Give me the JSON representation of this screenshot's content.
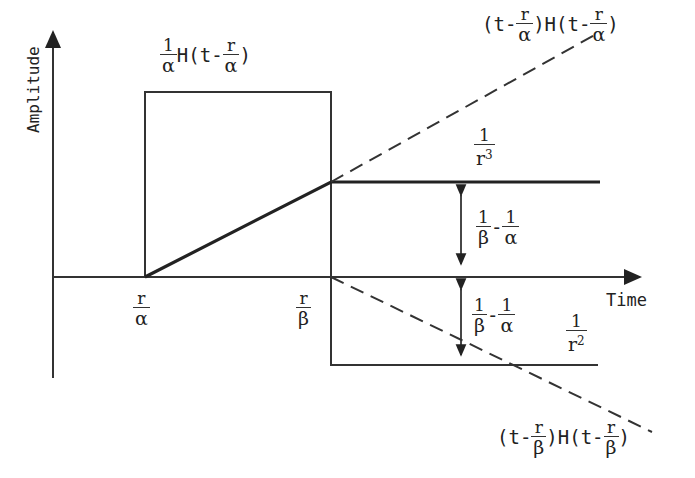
{
  "diagram": {
    "axes": {
      "y_label": "Amplitude",
      "x_label": "Time"
    },
    "x_ticks": [
      {
        "num": "r",
        "den": "α"
      },
      {
        "num": "r",
        "den": "β"
      }
    ],
    "labels": {
      "box": {
        "coef_num": "1",
        "coef_den": "α",
        "func": "H(t-",
        "arg_num": "r",
        "arg_den": "α",
        "close": ")"
      },
      "ramp_alpha": {
        "open": "(t-",
        "n1": "r",
        "d1": "α",
        "mid": ")H(t-",
        "n2": "r",
        "d2": "α",
        "close": ")"
      },
      "ramp_beta": {
        "open": "(t-",
        "n1": "r",
        "d1": "β",
        "mid": ")H(t-",
        "n2": "r",
        "d2": "β",
        "close": ")"
      },
      "r3": {
        "num": "1",
        "den": "r",
        "exp": "3"
      },
      "r2": {
        "num": "1",
        "den": "r",
        "exp": "2"
      },
      "diff_upper": {
        "n1": "1",
        "d1": "β",
        "sep": "-",
        "n2": "1",
        "d2": "α"
      },
      "diff_lower": {
        "n1": "1",
        "d1": "β",
        "sep": "-",
        "n2": "1",
        "d2": "α"
      }
    },
    "colors": {
      "line": "#222222",
      "background": "#ffffff"
    }
  }
}
